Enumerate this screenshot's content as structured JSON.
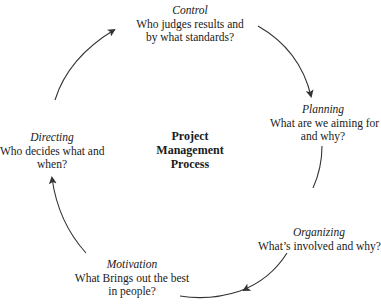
{
  "diagram": {
    "center": {
      "lines": [
        "Project",
        "Management",
        "Process"
      ]
    },
    "nodes": [
      {
        "id": "control",
        "title": "Control",
        "question_lines": [
          "Who judges results and",
          "by what standards?"
        ]
      },
      {
        "id": "planning",
        "title": "Planning",
        "question_lines": [
          "What are we aiming for",
          "and why?"
        ]
      },
      {
        "id": "organizing",
        "title": "Organizing",
        "question_lines": [
          "What’s involved and why?"
        ]
      },
      {
        "id": "motivation",
        "title": "Motivation",
        "question_lines": [
          "What Brings out the best",
          "in people?"
        ]
      },
      {
        "id": "directing",
        "title": "Directing",
        "question_lines": [
          "Who decides what and",
          "when?"
        ]
      }
    ],
    "flow": [
      "Control",
      "Planning",
      "Organizing",
      "Motivation",
      "Directing",
      "Control"
    ],
    "colors": {
      "line": "#333333",
      "text": "#1a1a1a",
      "background": "#ffffff"
    }
  }
}
